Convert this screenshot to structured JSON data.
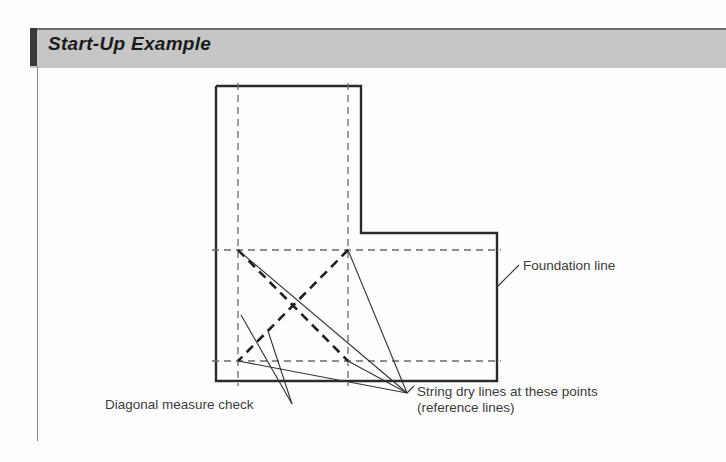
{
  "page": {
    "background_color": "#fefefe",
    "width": 726,
    "height": 462
  },
  "banner": {
    "title": "Start-Up Example",
    "background_color": "#c6c6c6",
    "accent_color": "#3a3a3a",
    "top_rule_color": "#6e6e6e"
  },
  "diagram": {
    "type": "line-drawing",
    "stroke_color": "#2b2b2b",
    "reference_line_color": "#6a6a6a",
    "labels": {
      "foundation_line": "Foundation line",
      "diagonal_measure_check": "Diagonal measure check",
      "string_dry_lines_1": "String dry lines at these points",
      "string_dry_lines_2": "(reference lines)"
    },
    "outline_points": "216,86 361,86 361,233 497,233 497,381 216,381",
    "reference_vertical_x": [
      238,
      348
    ],
    "reference_horizontal_y": [
      250,
      361
    ],
    "diagonal_check_corners": [
      [
        238,
        250
      ],
      [
        348,
        250
      ],
      [
        348,
        361
      ],
      [
        238,
        361
      ]
    ],
    "string_dry_line_points": [
      [
        238,
        250
      ],
      [
        348,
        250
      ],
      [
        238,
        361
      ],
      [
        348,
        361
      ]
    ],
    "leader_converge_string": [
      407,
      393
    ],
    "leader_converge_diagonal": [
      292,
      404
    ],
    "leader_foundation_from": [
      497,
      287
    ],
    "leader_foundation_to": [
      519,
      265
    ]
  }
}
